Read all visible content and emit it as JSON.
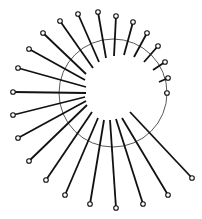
{
  "diagram": {
    "title": "",
    "width": 202,
    "height": 219,
    "colors": {
      "background": "#ffffff",
      "ring": "#444444",
      "pin": "#111111"
    },
    "ring": {
      "cx": 113,
      "cy": 93,
      "r": 54
    },
    "pin_head_radius": 2.3,
    "pins": [
      {
        "outer": [
          13,
          92
        ],
        "inner": [
          86,
          93
        ]
      },
      {
        "outer": [
          18,
          68
        ],
        "inner": [
          86,
          87
        ]
      },
      {
        "outer": [
          29,
          49
        ],
        "inner": [
          85,
          80
        ]
      },
      {
        "outer": [
          43,
          33
        ],
        "inner": [
          86,
          74
        ]
      },
      {
        "outer": [
          60,
          21
        ],
        "inner": [
          93,
          68
        ]
      },
      {
        "outer": [
          78,
          14
        ],
        "inner": [
          99,
          62
        ]
      },
      {
        "outer": [
          98,
          12
        ],
        "inner": [
          106,
          58
        ]
      },
      {
        "outer": [
          116,
          16
        ],
        "inner": [
          114,
          56
        ]
      },
      {
        "outer": [
          133,
          22
        ],
        "inner": [
          124,
          55
        ]
      },
      {
        "outer": [
          147,
          33
        ],
        "inner": [
          134,
          57
        ]
      },
      {
        "outer": [
          158,
          46
        ],
        "inner": [
          144,
          62
        ]
      },
      {
        "outer": [
          165,
          62
        ],
        "inner": [
          153,
          70
        ]
      },
      {
        "outer": [
          168,
          78
        ],
        "inner": [
          159,
          82
        ]
      },
      {
        "outer": [
          167,
          93
        ],
        "inner": [
          164,
          93
        ]
      },
      {
        "outer": [
          192,
          178
        ],
        "inner": [
          130,
          112
        ]
      },
      {
        "outer": [
          168,
          195
        ],
        "inner": [
          122,
          118
        ]
      },
      {
        "outer": [
          143,
          204
        ],
        "inner": [
          116,
          119
        ]
      },
      {
        "outer": [
          116,
          208
        ],
        "inner": [
          110,
          120
        ]
      },
      {
        "outer": [
          90,
          204
        ],
        "inner": [
          104,
          120
        ]
      },
      {
        "outer": [
          65,
          195
        ],
        "inner": [
          98,
          118
        ]
      },
      {
        "outer": [
          46,
          180
        ],
        "inner": [
          92,
          112
        ]
      },
      {
        "outer": [
          29,
          161
        ],
        "inner": [
          87,
          105
        ]
      },
      {
        "outer": [
          18,
          138
        ],
        "inner": [
          86,
          101
        ]
      },
      {
        "outer": [
          13,
          115
        ],
        "inner": [
          85,
          97
        ]
      }
    ]
  }
}
